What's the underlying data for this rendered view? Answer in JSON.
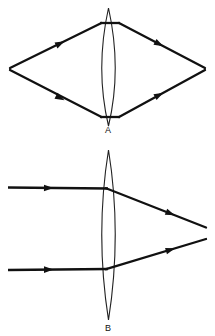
{
  "figure": {
    "background_color": "#ffffff",
    "stroke_color": "#111111",
    "lens_outline_color": "#222222",
    "width": 215,
    "height": 336
  },
  "diagrams": [
    {
      "id": "diagram-a",
      "label": "A",
      "label_x": 108,
      "label_y": 133,
      "description": "Point source rays diverge, pass through converging lens, and reconverge to a point image",
      "lens": {
        "center_x": 108.5,
        "top_y": 8,
        "bottom_y": 126,
        "half_width": 13.5,
        "axis_y": 69
      },
      "object_point": {
        "x": 10,
        "y": 69
      },
      "image_point": {
        "x": 205,
        "y": 69
      },
      "rays": [
        {
          "name": "upper-incident-ray",
          "x1": 10,
          "y1": 68,
          "x2": 101,
          "y2": 23,
          "arrow_t": 0.55
        },
        {
          "name": "lower-incident-ray",
          "x1": 10,
          "y1": 70,
          "x2": 101,
          "y2": 117,
          "arrow_t": 0.55
        },
        {
          "name": "upper-lens-chord",
          "x1": 101,
          "y1": 23,
          "x2": 120,
          "y2": 23,
          "arrow_t": null
        },
        {
          "name": "lower-lens-chord",
          "x1": 101,
          "y1": 117,
          "x2": 120,
          "y2": 117,
          "arrow_t": null
        },
        {
          "name": "upper-refracted-ray",
          "x1": 120,
          "y1": 23,
          "x2": 205,
          "y2": 68,
          "arrow_t": 0.42
        },
        {
          "name": "lower-refracted-ray",
          "x1": 120,
          "y1": 117,
          "x2": 205,
          "y2": 70,
          "arrow_t": 0.42
        }
      ]
    },
    {
      "id": "diagram-b",
      "label": "B",
      "label_x": 108,
      "label_y": 331,
      "description": "Parallel rays enter converging lens and meet at the focal point",
      "lens": {
        "center_x": 108.5,
        "top_y": 150,
        "bottom_y": 320,
        "half_width": 13.5,
        "axis_y": 234
      },
      "focal_point": {
        "x": 206,
        "y": 233
      },
      "rays": [
        {
          "name": "upper-parallel-incident-ray",
          "x1": 8,
          "y1": 187,
          "x2": 108,
          "y2": 188,
          "arrow_t": 0.42
        },
        {
          "name": "lower-parallel-incident-ray",
          "x1": 8,
          "y1": 270,
          "x2": 108,
          "y2": 269,
          "arrow_t": 0.42
        },
        {
          "name": "upper-converging-ray",
          "x1": 108,
          "y1": 188,
          "x2": 206,
          "y2": 227,
          "arrow_t": 0.62
        },
        {
          "name": "lower-converging-ray",
          "x1": 108,
          "y1": 269,
          "x2": 206,
          "y2": 239,
          "arrow_t": 0.62
        }
      ]
    }
  ]
}
